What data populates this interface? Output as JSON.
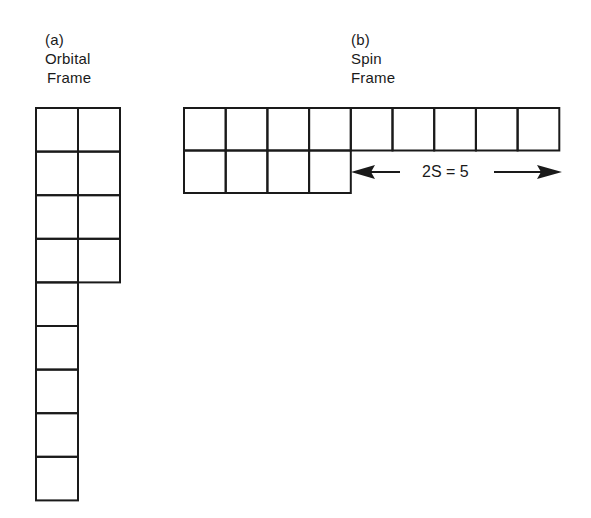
{
  "panels": {
    "a": {
      "tag": "(a)",
      "title_line1": "Orbital",
      "title_line2": "Frame",
      "rows": [
        2,
        2,
        2,
        2,
        1,
        1,
        1,
        1,
        1
      ]
    },
    "b": {
      "tag": "(b)",
      "title_line1": "Spin",
      "title_line2": "Frame",
      "rows": [
        9,
        4
      ],
      "annotation": "2S = 5"
    }
  },
  "colors": {
    "line": "#1a1a1a",
    "background": "#ffffff"
  }
}
